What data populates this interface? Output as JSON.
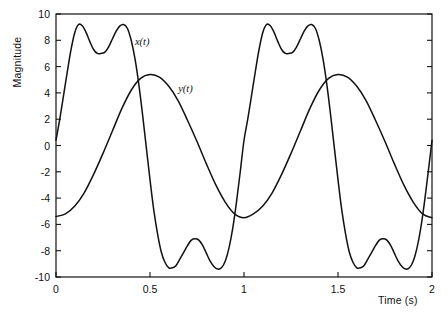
{
  "chart_data": {
    "type": "line",
    "title": "",
    "xlabel": "Time (s)",
    "ylabel": "Magnitude",
    "xlim": [
      0,
      2
    ],
    "ylim": [
      -10,
      10
    ],
    "grid": false,
    "legend_position": "inline-annotations",
    "xticks": [
      0,
      0.5,
      1,
      1.5,
      2
    ],
    "xtick_labels": [
      "0",
      "0.5",
      "1",
      "1.5",
      "2"
    ],
    "yticks": [
      -10,
      -8,
      -6,
      -4,
      -2,
      0,
      2,
      4,
      6,
      8,
      10
    ],
    "ytick_labels": [
      "-10",
      "-8",
      "-6",
      "-4",
      "-2",
      "0",
      "2",
      "4",
      "6",
      "8",
      "10"
    ],
    "annotations": [
      {
        "text": "x(t)",
        "x": 0.42,
        "y": 7.8
      },
      {
        "text": "y(t)",
        "x": 0.65,
        "y": 4.2
      }
    ],
    "series": [
      {
        "name": "x(t)",
        "label": "x(t)",
        "color": "#111111",
        "description": "Composite periodic signal, period 1 s, double-humped crests near +9.2 with a dip to +7.0, and double troughs near -9.3 with a rise to -7.1",
        "period": 1.0,
        "max": 9.2,
        "min": -9.4,
        "value_at_t0": 0.4,
        "value_at_t2": -1.0,
        "x": [
          0,
          0.02,
          0.04,
          0.06,
          0.08,
          0.1,
          0.12,
          0.14,
          0.16,
          0.18,
          0.2,
          0.22,
          0.24,
          0.26,
          0.28,
          0.3,
          0.32,
          0.34,
          0.36,
          0.38,
          0.4,
          0.42,
          0.44,
          0.46,
          0.48,
          0.5,
          0.52,
          0.54,
          0.56,
          0.58,
          0.6,
          0.62,
          0.64,
          0.66,
          0.68,
          0.7,
          0.72,
          0.74,
          0.76,
          0.78,
          0.8,
          0.82,
          0.84,
          0.86,
          0.88,
          0.9,
          0.92,
          0.94,
          0.96,
          0.98,
          1.0
        ],
        "values": [
          0.4,
          2.0,
          3.8,
          5.6,
          7.3,
          8.6,
          9.2,
          9.1,
          8.6,
          7.9,
          7.3,
          7.0,
          7.0,
          7.1,
          7.5,
          8.1,
          8.7,
          9.1,
          9.2,
          8.9,
          8.0,
          6.6,
          4.7,
          2.4,
          -0.1,
          -2.6,
          -4.9,
          -6.7,
          -8.1,
          -8.9,
          -9.3,
          -9.3,
          -9.1,
          -8.6,
          -8.1,
          -7.6,
          -7.2,
          -7.1,
          -7.2,
          -7.6,
          -8.2,
          -8.8,
          -9.2,
          -9.4,
          -9.3,
          -8.8,
          -7.8,
          -6.3,
          -4.3,
          -2.0,
          0.4
        ]
      },
      {
        "name": "y(t)",
        "label": "y(t)",
        "color": "#111111",
        "description": "Smooth near-sinusoidal signal, period 1 s, amplitude about 5.4, starting near -5.4 at t=0 and peaking near +5.4 at t=0.5",
        "period": 1.0,
        "max": 5.4,
        "min": -5.5,
        "value_at_t0": -5.4,
        "value_at_t2": -5.6,
        "x": [
          0,
          0.05,
          0.1,
          0.15,
          0.2,
          0.25,
          0.3,
          0.35,
          0.4,
          0.45,
          0.5,
          0.55,
          0.6,
          0.65,
          0.7,
          0.75,
          0.8,
          0.85,
          0.9,
          0.95,
          1.0
        ],
        "values": [
          -5.4,
          -5.2,
          -4.6,
          -3.6,
          -2.2,
          -0.6,
          1.1,
          2.8,
          4.2,
          5.1,
          5.4,
          5.2,
          4.5,
          3.4,
          1.9,
          0.3,
          -1.4,
          -3.0,
          -4.3,
          -5.2,
          -5.5
        ]
      }
    ]
  }
}
